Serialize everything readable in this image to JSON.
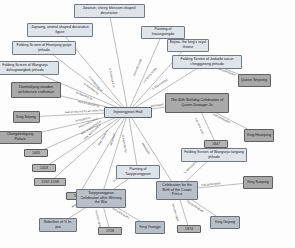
{
  "diagram": {
    "center": {
      "id": "injeongjeon",
      "label": "Injeongjeon Hall",
      "x": 128,
      "y": 112,
      "w": 48,
      "h": 11,
      "style": "center"
    },
    "nodes": [
      {
        "id": "jwawun",
        "label": "Jiwanun, cherry blossom-shaped decoration",
        "x": 109,
        "y": 11,
        "w": 71,
        "h": 14,
        "style": "light"
      },
      {
        "id": "japsang",
        "label": "Japsang, animal-shaped decorative figure",
        "x": 60,
        "y": 30,
        "w": 66,
        "h": 14,
        "style": "light"
      },
      {
        "id": "fs-heonjong",
        "label": "Folding Screen of Heonjong gatye jinhado",
        "x": 44,
        "y": 48,
        "w": 64,
        "h": 14,
        "style": "light"
      },
      {
        "id": "fs-wangseja",
        "label": "Folding Screen of Wangseja dohugwongbok jinhado",
        "x": 25,
        "y": 68,
        "w": 68,
        "h": 14,
        "style": "light"
      },
      {
        "id": "painting-hwa",
        "label": "Painting of Inwangsingdo",
        "x": 163,
        "y": 32,
        "w": 44,
        "h": 13,
        "style": "light"
      },
      {
        "id": "eojwa",
        "label": "Eojwa, the king's royal throne",
        "x": 188,
        "y": 45,
        "w": 42,
        "h": 13,
        "style": "light"
      },
      {
        "id": "fs-jodaebi",
        "label": "Folding Screen of Jodaebi sasun chinggyeong jinhado",
        "x": 207,
        "y": 62,
        "w": 70,
        "h": 14,
        "style": "light"
      },
      {
        "id": "queen-sinjeong",
        "label": "Queen Sinjeong",
        "x": 254,
        "y": 80,
        "w": 33,
        "h": 13,
        "style": "dark"
      },
      {
        "id": "daemokjang",
        "label": "Daemokjang wooden architecture craftsman",
        "x": 36,
        "y": 90,
        "w": 50,
        "h": 16,
        "style": "dark"
      },
      {
        "id": "king-sejong",
        "label": "King Sejong",
        "x": 26,
        "y": 117,
        "w": 27,
        "h": 12,
        "style": "dark"
      },
      {
        "id": "changdeokgung",
        "label": "Changdeokgung Palace",
        "x": 20,
        "y": 137,
        "w": 43,
        "h": 13,
        "style": "dark"
      },
      {
        "id": "y1405",
        "label": "1405",
        "x": 36,
        "y": 153,
        "w": 24,
        "h": 8,
        "style": "year"
      },
      {
        "id": "y1418",
        "label": "1418",
        "x": 44,
        "y": 168,
        "w": 24,
        "h": 8,
        "style": "year"
      },
      {
        "id": "y1592",
        "label": "1592-1598",
        "x": 50,
        "y": 182,
        "w": 32,
        "h": 8,
        "style": "year"
      },
      {
        "id": "y1609",
        "label": "1609",
        "x": 78,
        "y": 196,
        "w": 24,
        "h": 8,
        "style": "year"
      },
      {
        "id": "birthday40",
        "label": "The 40th Birthday Celebration of Queen Dowager Jo",
        "x": 197,
        "y": 103,
        "w": 64,
        "h": 20,
        "style": "dark"
      },
      {
        "id": "y1847",
        "label": "1847",
        "x": 216,
        "y": 144,
        "w": 24,
        "h": 8,
        "style": "year"
      },
      {
        "id": "king-heonjong",
        "label": "King Heonjong",
        "x": 259,
        "y": 135,
        "w": 30,
        "h": 13,
        "style": "dark"
      },
      {
        "id": "fs-tangang",
        "label": "Folding Screen of Wangseja tangang jinhado",
        "x": 214,
        "y": 155,
        "w": 66,
        "h": 14,
        "style": "light"
      },
      {
        "id": "painting-tpy",
        "label": "Painting of Taepyeongyeon",
        "x": 138,
        "y": 172,
        "w": 44,
        "h": 14,
        "style": "light"
      },
      {
        "id": "tpy-celebration",
        "label": "Taepyeongyeon Celebration after Winning the War",
        "x": 101,
        "y": 198,
        "w": 50,
        "h": 19,
        "style": "mid"
      },
      {
        "id": "crown-prince",
        "label": "Celebration for the Birth of the Crown Prince",
        "x": 177,
        "y": 190,
        "w": 42,
        "h": 19,
        "style": "mid"
      },
      {
        "id": "king-sunjong",
        "label": "King Sunjong",
        "x": 258,
        "y": 182,
        "w": 30,
        "h": 13,
        "style": "dark"
      },
      {
        "id": "rebellion",
        "label": "Rebellion of Yi In-jwa",
        "x": 58,
        "y": 225,
        "w": 38,
        "h": 14,
        "style": "mid"
      },
      {
        "id": "y1728",
        "label": "1728",
        "x": 110,
        "y": 231,
        "w": 24,
        "h": 8,
        "style": "year"
      },
      {
        "id": "king-yeongjo",
        "label": "King Yeongjo",
        "x": 150,
        "y": 227,
        "w": 30,
        "h": 13,
        "style": "mid"
      },
      {
        "id": "y1874",
        "label": "1874",
        "x": 189,
        "y": 229,
        "w": 24,
        "h": 8,
        "style": "year"
      },
      {
        "id": "king-gojong",
        "label": "King Gojong",
        "x": 225,
        "y": 222,
        "w": 30,
        "h": 13,
        "style": "mid"
      }
    ],
    "edges": [
      {
        "from": "injeongjeon",
        "to": "jwawun",
        "label": "is composed of"
      },
      {
        "from": "injeongjeon",
        "to": "japsang",
        "label": "is composed of"
      },
      {
        "from": "injeongjeon",
        "to": "fs-heonjong",
        "label": "is depicted by"
      },
      {
        "from": "injeongjeon",
        "to": "fs-wangseja",
        "label": "is depicted by"
      },
      {
        "from": "injeongjeon",
        "to": "painting-hwa",
        "label": "currently holds"
      },
      {
        "from": "injeongjeon",
        "to": "eojwa",
        "label": "currently holds"
      },
      {
        "from": "injeongjeon",
        "to": "fs-jodaebi",
        "label": "is depicted by"
      },
      {
        "from": "injeongjeon",
        "to": "daemokjang",
        "label": "was produced by"
      },
      {
        "from": "injeongjeon",
        "to": "king-sejong",
        "label": "was produced by an order from"
      },
      {
        "from": "injeongjeon",
        "to": "changdeokgung",
        "label": "is located in"
      },
      {
        "from": "injeongjeon",
        "to": "y1405",
        "label": "was produced in"
      },
      {
        "from": "injeongjeon",
        "to": "y1418",
        "label": "was augmented in"
      },
      {
        "from": "injeongjeon",
        "to": "y1592",
        "label": "was destroyed in"
      },
      {
        "from": "injeongjeon",
        "to": "y1609",
        "label": "was rebuilt in"
      },
      {
        "from": "injeongjeon",
        "to": "birthday40",
        "label": "witnessed"
      },
      {
        "from": "injeongjeon",
        "to": "painting-tpy",
        "label": "is depicted by"
      },
      {
        "from": "injeongjeon",
        "to": "crown-prince",
        "label": "witnessed"
      },
      {
        "from": "injeongjeon",
        "to": "tpy-celebration",
        "label": "witnessed"
      },
      {
        "from": "fs-jodaebi",
        "to": "queen-sinjeong",
        "label": "had participant"
      },
      {
        "from": "birthday40",
        "to": "y1847",
        "label": "has time span"
      },
      {
        "from": "birthday40",
        "to": "king-heonjong",
        "label": "had participant"
      },
      {
        "from": "crown-prince",
        "to": "fs-tangang",
        "label": "is depicted by"
      },
      {
        "from": "crown-prince",
        "to": "king-sunjong",
        "label": "had participant"
      },
      {
        "from": "crown-prince",
        "to": "y1874",
        "label": "has time span"
      },
      {
        "from": "crown-prince",
        "to": "king-gojong",
        "label": "had participant"
      },
      {
        "from": "painting-tpy",
        "to": "tpy-celebration",
        "label": "is depicted by"
      },
      {
        "from": "tpy-celebration",
        "to": "rebellion",
        "label": "was influenced by"
      },
      {
        "from": "tpy-celebration",
        "to": "y1728",
        "label": "has time span"
      },
      {
        "from": "tpy-celebration",
        "to": "king-yeongjo",
        "label": "had participant"
      }
    ],
    "colors": {
      "node_light": "#dfe3ea",
      "node_mid": "#b9bfc8",
      "node_dark": "#a9a9a9",
      "edge": "#6b6b6b",
      "edge_label": "#4a4a4a",
      "background": "#fdfdfd"
    }
  }
}
